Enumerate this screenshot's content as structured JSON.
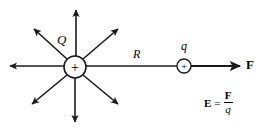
{
  "figure": {
    "background_color": "#ffffff",
    "stroke_color": "#1a1a1a",
    "width": 263,
    "height": 131
  },
  "labels": {
    "source_charge": "Q",
    "distance": "R",
    "test_charge": "q",
    "force": "F",
    "source_charge_sign": "+",
    "test_charge_sign": "+"
  },
  "equation": {
    "lhs": "E",
    "equals": "=",
    "numerator": "F",
    "denominator": "q",
    "full_text": "E = F/q"
  },
  "diagram": {
    "source_charge_circle": {
      "cx": 75,
      "cy": 67,
      "r": 11
    },
    "test_charge_circle": {
      "cx": 184,
      "cy": 66,
      "r": 7
    },
    "field_arrow_count": 8,
    "field_arrow_directions": [
      "up",
      "up-right",
      "right",
      "down-right",
      "down",
      "down-left",
      "left",
      "up-left"
    ],
    "force_arrow": {
      "from_x": 191,
      "to_x": 243,
      "y": 66
    },
    "distance_line": {
      "from_x": 86,
      "to_x": 177,
      "y": 66
    }
  }
}
